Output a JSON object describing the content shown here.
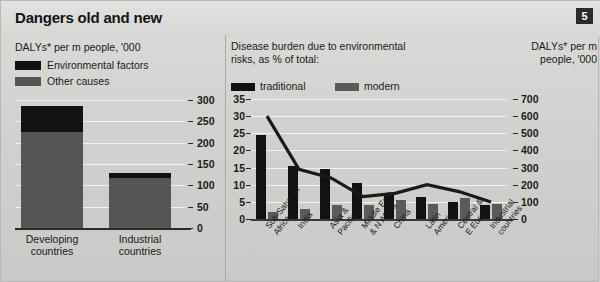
{
  "header": {
    "title": "Dangers old and new",
    "badge": "5"
  },
  "left": {
    "subtitle": "DALYs* per m people, '000",
    "legend": [
      {
        "label": "Environmental factors",
        "color": "#121212"
      },
      {
        "label": "Other causes",
        "color": "#555553"
      }
    ],
    "axis_ticks": [
      "300",
      "250",
      "200",
      "150",
      "100",
      "50",
      "0"
    ],
    "categories": [
      "Developing\ncountries",
      "Industrial\ncountries"
    ],
    "cat_line1": [
      "Developing",
      "Industrial"
    ],
    "cat_line2": [
      "countries",
      "countries"
    ]
  },
  "right": {
    "title": "Disease burden due to environmental risks, as % of total:",
    "title_line1": "Disease burden due to environmental",
    "title_line2": "risks, as % of total:",
    "legend": [
      {
        "label": "traditional",
        "color": "#121212"
      },
      {
        "label": "modern",
        "color": "#5a5a58"
      }
    ],
    "right_axis_title_line1": "DALYs* per m",
    "right_axis_title_line2": "people, '000",
    "left_axis_ticks": [
      "35",
      "30",
      "25",
      "20",
      "15",
      "10",
      "5",
      "0"
    ],
    "right_axis_ticks": [
      "700",
      "600",
      "500",
      "400",
      "300",
      "200",
      "100",
      "0"
    ]
  },
  "chart_data": [
    {
      "type": "bar",
      "id": "left-stacked-bar",
      "title": "DALYs* per m people, '000",
      "stacked": true,
      "categories": [
        "Developing countries",
        "Industrial countries"
      ],
      "series": [
        {
          "name": "Other causes",
          "color": "#555553",
          "values": [
            225,
            118
          ]
        },
        {
          "name": "Environmental factors",
          "color": "#121212",
          "values": [
            60,
            10
          ]
        }
      ],
      "totals": [
        285,
        128
      ],
      "ylabel": "DALYs* per m people, '000",
      "xlabel": "",
      "ylim": [
        0,
        300
      ],
      "yticks": [
        0,
        50,
        100,
        150,
        200,
        250,
        300
      ],
      "grid": true,
      "legend_position": "top-left"
    },
    {
      "type": "bar",
      "id": "right-grouped-bar-with-line",
      "title": "Disease burden due to environmental risks, as % of total:",
      "categories": [
        "Sub-Saharan Africa",
        "India",
        "Asia & Pacific",
        "Middle East & N Africa",
        "China",
        "Latin America",
        "Central & E Europe",
        "Industrial countries"
      ],
      "series": [
        {
          "name": "traditional",
          "color": "#121212",
          "axis": "left",
          "values": [
            24.5,
            15.5,
            14.5,
            10.5,
            7.0,
            6.5,
            5.0,
            4.0
          ]
        },
        {
          "name": "modern",
          "color": "#5a5a58",
          "axis": "left",
          "values": [
            2.0,
            3.0,
            4.0,
            4.0,
            5.5,
            4.5,
            6.0,
            4.5
          ]
        },
        {
          "name": "DALYs per m people",
          "color": "#1a1a1a",
          "axis": "right",
          "type": "line",
          "values": [
            600,
            290,
            240,
            130,
            150,
            200,
            160,
            100
          ]
        }
      ],
      "ylabel": "% of total",
      "y2label": "DALYs* per m people, '000",
      "ylim": [
        0,
        35
      ],
      "yticks": [
        0,
        5,
        10,
        15,
        20,
        25,
        30,
        35
      ],
      "y2lim": [
        0,
        700
      ],
      "y2ticks": [
        0,
        100,
        200,
        300,
        400,
        500,
        600,
        700
      ],
      "grid": true,
      "legend_position": "top-left"
    }
  ]
}
